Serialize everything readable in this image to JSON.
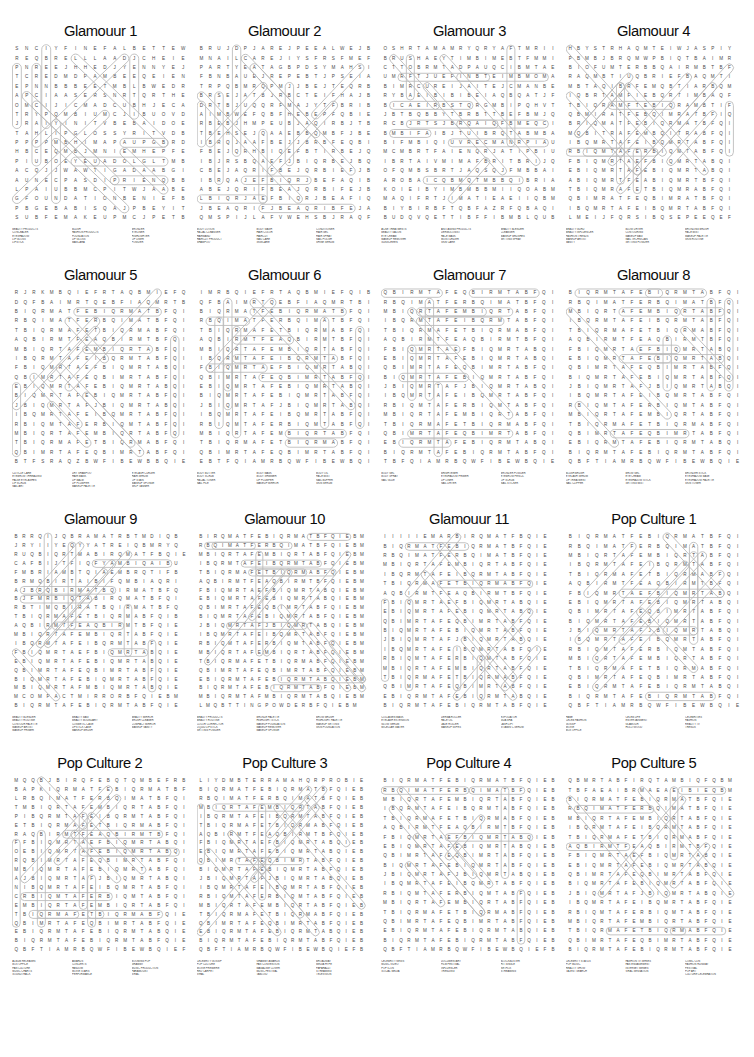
{
  "page": {
    "background_color": "#ffffff",
    "grid_letter_color": "#4a4a4a",
    "ring_color": "#b9b9b9",
    "title_color": "#0b0b0b",
    "layout": "4 columns x 4 rows of word-search puzzles",
    "rows": 4,
    "columns": 4
  },
  "puzzles": [
    {
      "title": "Glamouur 1",
      "grid_cols": 18,
      "grid_rows": 19,
      "grid": [
        "SNCIYFINEFALBETTEWB",
        "REQBRELLLAADJCHEIEQB",
        "PNREEJHHEDJYENNYEJ",
        "TCREDMDPAMBEEQEIENI",
        "EPNNBBBEETMBLBWEDRB",
        "APCIAASERSNRTQRTHEQD",
        "OMCIJICMADCUBHJECATE",
        "TRYPQMBIUMCJIBUOVDHI",
        "JRAIYINITVBEBAIDOEM",
        "TAHLIPGLOSSYRITVDBIS",
        "PPPPMBHIMAPAUPGBRDLT",
        "HBCEQMBJMNIEMHEPFEQ",
        "PIUBOEYEUADOLGLTMBQ",
        "ACQJJWAWTIGADAABGIP",
        "AUNECPASDIPRIENQBBQL",
        "LPAIUBBMCPITWJAABEQB",
        "GFOUNDATIONBENIEFBP",
        "PBGEBABISQAJPBEYITIN",
        "SUBFEMAKEUPMCJPETBQE"
      ],
      "words": [
        [
          "BEAUTY PRODUCTS",
          "CONCEALER",
          "EYESHADOW",
          "LIP GLOSS",
          "LIPSTICK"
        ],
        [
          "BLUSH",
          "FASHION PRODUCTS",
          "FOUNDATION",
          "LIP GLOSS",
          "MASCARA"
        ],
        [
          "BRONZER",
          "EYELINER",
          "HIGHLIGHTER",
          "LIP LINER",
          "POWDER"
        ]
      ]
    },
    {
      "title": "Glamouur 2",
      "grid_cols": 20,
      "grid_rows": 19,
      "grid": [
        "BRUJDPJAREJPEEALWEJBTT",
        "MNAILCAREJIYSFRSFMEFMG",
        "PARTYEATAGBPDSYMAHSIPWU",
        "FBNBAUEJREPEBTJPSEIAFR",
        "TRPQBMRQPMJJBEJTEQRBAE",
        "BRSEJATBJRBCTEIFHAJBIN",
        "DRTBJUQQRFMAJYTFBRIBQU",
        "AIMBWEFQBFHEBEPFQBIEAR",
        "RBEBJHMPEUBJAQIRBJTBAB",
        "TBEHSEJQAAEBBQMBFJBEIT",
        "IBRQJAAFBEJJBRBFEQBIJA",
        "FBEJQRHBIQEFBTIRBEJQBE",
        "IBJRSBQAEFJBIQRBEJBQAR",
        "CBEJAQRIFBEJQRBIEFJBQA",
        "IBRQAJEFBIQRJBEFAQIBRE",
        "ABEJQRIFBEAJQRBIFEJBQR",
        "LBIQRJAEFBIQRJBEAFIQBR",
        "JBEAQRIFJBEAQRIBFEJAQR",
        "QMSPIJLAFVWEHSBJRAQFIE"
      ],
      "words": [
        [
          "BODY LOTION",
          "FACIAL CLEANSER",
          "HAIRBAND",
          "HAIRCUT PRODUCT",
          "SHAMPOO"
        ],
        [
          "BODY WASH",
          "HAIR COLOR",
          "HAIRCUT",
          "NAIL CARE",
          "SKINCARE"
        ],
        [
          "CONDITIONER",
          "HAIR GEL",
          "HAIR SPRAY",
          "NAIL POLISH",
          "SHINE SERUM"
        ]
      ]
    },
    {
      "title": "Glamouur 3",
      "grid_cols": 21,
      "grid_rows": 19,
      "grid": [
        "OSHRTAMAMRYQRYAFTMRIITM",
        "BRUSHAEYTIMBIMEBTFMMIU",
        "CTTOBRMTADPAUQCIBMTAE",
        "UMRFTJUEFINBTEIMBMOMAE",
        "BIMRCUREIJAITEJCMANBEB",
        "RYBAEIBIBIBEIAQBQATJFB",
        "BICAEIRBSTQRGMBIPQHVTBI",
        "JBTBQBBYTBRBTTBEFBMJQU",
        "RCBJRTSJBRQAIQFBMEQCIB",
        "BMBIFAIBJTUIBRQTABMBAA",
        "BIFMBIQIUVRECMANRPIAU",
        "MCMBRTFAIENQRJATIPBIU",
        "IBRTAIVMIMAFBRITBRIJQUT",
        "OFQMBSBRTJAQSQJFMBBAIF",
        "AROBAICQBMQTMBBQIBRIAE",
        "KOIEIBYIMBMBBMIIQOABMB",
        "MAQIFRTJIMATIEAEIIQBM",
        "BIYBIRBFTQBFAZRFQBAQIB",
        "BUDQVQETTIBFFIBMBLQUB"
      ],
      "words": [
        [
          "ACNE TREATMENTS",
          "BEAUTY SALON",
          "EYE CREAM",
          "MAKEUP REMOVER",
          "SUNSCREEN"
        ],
        [
          "ANTI AGING PRODUCTS",
          "DERMOLOGIST",
          "FACE MASK",
          "MOISTURIZER",
          "SKIN CARE"
        ],
        [
          "BEAUTY BLENDER",
          "CLEANSER",
          "MAKEUP BRUSHES",
          "SETTING SPRAY"
        ]
      ]
    },
    {
      "title": "Glamouur 4",
      "grid_cols": 21,
      "grid_rows": 19,
      "grid": [
        "HBYSTRHAQMTEIWJASPIY",
        "PBMBJBRQMWPBIQTBAIMR",
        "BIOFUMTERBBQAIRMBTBF",
        "RAQMBTIUQBRIEFBAQMTI",
        "MBTAQIBRFEMQBTIARBQM",
        "IQBRTAMFIEBQRTIMBAQF",
        "TBIQRAMFTEBIQRAMBTIF",
        "QBMIRATFEBQIMRATBFIQ",
        "BRIQMATFEBIQRMATBFQI",
        "MQBITRAFEMBQITRABFQI",
        "IBQMRTAFEIBQMRTABFQI",
        "RBIQMTAFERBIQMTABFQI",
        "FBIQMRTAEFBIQMRTABQI",
        "EBIQMRTAFEBIQMRTABQI",
        "ABIQMRTFEABIQMRTBFQI",
        "TBIQMRAFETBIQMRABFQI",
        "QBIMRATFEQBIMRATBFQI",
        "IBQMRTAFEIBQMRTABFQI",
        "LMEIJFQRSIBQSEPEEQEF"
      ],
      "words": [
        [
          "BEAUTY GURU",
          "BEAUTY INFLUENCER",
          "FASHION TRENDS",
          "MAKEUP ARTIST",
          "VANITY"
        ],
        [
          "BLOW DRYER",
          "CONTOURING",
          "MAKEUP BAG",
          "NAIL TECHNICIAN",
          "SETTING POWDER"
        ],
        [
          "BRONZING BRUSH",
          "FACE MIST",
          "MAKEUP PALETTE",
          "SKIN ROUTINE"
        ]
      ]
    },
    {
      "title": "Glamouur 5",
      "grid_cols": 20,
      "grid_rows": 19,
      "grid": [
        "RJRKMBQIEFRTAQBMIEFQ",
        "DQFBAIMRTQEBFIAQMRTB",
        "BIQRMATFEBIQRMATBFQI",
        "RBQIMATFERBQIMATBFQI",
        "TBIQRMAFETBIQRMABFQI",
        "AQBIRMTFEAQBIRMTBFQI",
        "MBIQRTAFEMBIQRTABFQI",
        "IBQRMTAFEIBQRMTABFQI",
        "FBIQMRTAEFBIQMRTABQI",
        "QBIMRTAFEQBIMRTABFQI",
        "EBIQMRTAFEBIQMRTABQI",
        "BIQMRTAFEBIQMRTABFQI",
        "JBIQMRTAFJBIQMRTABQI",
        "IBQMRTAFEIBQMRTABFQI",
        "RBIQMTAFERBIQMTABFQI",
        "MBIQRTAFEMBIQRTABFQI",
        "TBIQRMAFETBIQRMABFQI",
        "QBIMRTAFEQBIMRTABFQI",
        "BTFSRAQZBWFIBEWBBQIE"
      ],
      "words": [
        [
          "CUTICLE CARE",
          "EYEBROW THREADING",
          "FALSE EYELASHES",
          "LIP SCRUB",
          "NAIL ART"
        ],
        [
          "DRY SHAMPOO",
          "HAIR MASK",
          "LIP BALM",
          "LIP PLUMPER",
          "MAKEUP PALETTE"
        ],
        [
          "EYELASH CURLER",
          "HAIR SERUM",
          "LIP STAIN",
          "MAKEUP SPONGE",
          "SELF TANNER"
        ]
      ]
    },
    {
      "title": "Glamouur 6",
      "grid_cols": 20,
      "grid_rows": 19,
      "grid": [
        "IMRBQIEFRTAQBMIEFQIB",
        "QFBAIMRTQEBFIAQMRTBI",
        "BIQRMATFEBIQRMATBFQI",
        "RBQIMATFERBQIMATBFQI",
        "TBIQRMAFETBIQRMABFQI",
        "AQBIRMTFEAQBIRMTBFQI",
        "MBIQRTAFEMBIQRTABFQI",
        "IBQRMTAFEIBQRMTABFQI",
        "FBIQMRTAEFBIQMRTABQI",
        "QBIMRTAFEQBIMRTABFQI",
        "EBIQMRTAFEBIQMRTABQI",
        "BIQMRTAFEBIQMRTABFQI",
        "JBIQMRTAFJBIQMRTABQI",
        "IBQMRTAFEIBQMRTABFQI",
        "RBIQMTAFERBIQMTABFQI",
        "MBIQRTAFEMBIQRTABFQI",
        "TBIQRMAFETBIQRMABFQI",
        "QBIMRTAFEQBIMRTABFQI",
        "EBTFQIAMRBQWFIBEWBQI"
      ],
      "words": [
        [
          "BODY BUTTER",
          "BODY SCRUB",
          "FACIAL TONER",
          "NAIL FILE"
        ],
        [
          "BODY MASK",
          "BODY SHIMMER",
          "LIP PLUMPER",
          "MAKEUP MIRROR"
        ],
        [
          "BODY OIL",
          "FACE MIST",
          "NAIL BUFFER",
          "SKIN SERUM"
        ]
      ]
    },
    {
      "title": "Glamouur 7",
      "grid_cols": 20,
      "grid_rows": 19,
      "grid": [
        "QBIRMTAFEQBIRMTABFQIE",
        "RBQIMATFERBQIMATBFQIE",
        "MBIQRTAFEMBIQRTABFQIE",
        "IBQRMTAFEIBQRMTABFQIE",
        "TBIQRMAFETBIQRMABFQIE",
        "AQBIRMTFEAQBIRMTBFQIE",
        "FBIQMRTAEFBIQMRTABQIE",
        "EBIQMRTAFEBIQMRTABQIE",
        "QBIMRTAFEQBIMRTABFQIE",
        "BIQMRTAFEBIQMRTABFQIE",
        "JBIQMRTAFJBIQMRTABQIE",
        "IBQMRTAFEIBQMRTABFQIE",
        "RBIQMTAFERBIQMTABFQIE",
        "MBIQRTAFEMBIQRTABFQIE",
        "TBIQRMAFETBIQRMABFQIE",
        "QBIMRTAFEQBIMRTABFQIE",
        "EBIQRMTAFEBIQRMTABQIE",
        "BIQRMTAFEBIQRMTABFQIE",
        "TBFQIAMRBQWFIBEWBQIEF"
      ],
      "words": [
        [
          "BODY GEL",
          "BODY SPRAY",
          "NAIL GLUE"
        ],
        [
          "BRIGHTENER",
          "EYESHADOW PRIMER",
          "LIP LINER",
          "NAIL DRYER"
        ],
        [
          "BRONZER POWDER",
          "EYEBROW PENCIL",
          "LIP SCRUB",
          "NAIL STICKER"
        ]
      ]
    },
    {
      "title": "Glamouur 8",
      "grid_cols": 20,
      "grid_rows": 19,
      "grid": [
        "BIQRMTAFEBIQRMTABFQIE",
        "RBQIMATFERBQIMATBFQIE",
        "MBIQRTAFEMBIQRTABFQIE",
        "IBQRMTAFEIBQRMTABFQIE",
        "TBIQRMAFETBIQRMABFQIE",
        "AQBIRMTFEAQBIRMTBFQIE",
        "FBIQMRTAEFBIQMRTABQIE",
        "EBIQMRTAFEBIQMRTABQIE",
        "QBIMRTAFEQBIMRTABFQIE",
        "BIQMRTAFEBIQMRTABFQIE",
        "JBIQMRTAFJBIQMRTABQIE",
        "IBQMRTAFEIBQMRTABFQIE",
        "RBIQMTAFERBIQMTABFQIE",
        "MBIQRTAFEMBIQRTABFQIE",
        "TBIQRMAFETBIQRMABFQIE",
        "QBIMRTAFEQBIMRTABFQIE",
        "EBIQRMTAFEBIQRMTABQIE",
        "BIQRMTAFEBIQRMTABFQIE",
        "QBFTIAMRBQWFIBEWBQIEF"
      ],
      "words": [
        [
          "BLUSH BRUSH",
          "EYELASH SERUM",
          "LIP TREATMENT",
          "NAIL CLIPPER"
        ],
        [
          "BROW GEL",
          "EYE CREAM",
          "EYESHADOW STICK",
          "SETTING MIST"
        ],
        [
          "BRONZER STICK",
          "EYESHADOW BASE",
          "EYESHADOW PALETTE",
          "SKIN TONER"
        ]
      ]
    },
    {
      "title": "Glamouur 9",
      "grid_cols": 22,
      "grid_rows": 20,
      "grid": [
        "BRRQIJQBRAMATRBTMDIQB",
        "JRYIIYEQYYATREIQBMRYQ",
        "RUQBIQRTMABIRQMATFBQIE",
        "CAFBIJTFIQFYAMBIQAIBU",
        "FMBRIAMBTQIAEMBRQTIFB",
        "BRMQBIRTAIBIFQMBIAQRI",
        "AJBRQBIRMATBQIRMATBFQ",
        "BJFMRBIQTABIRQMATBFQI",
        "RBTIMQBIRATBQIRMATBFQ",
        "TBIQRMAFETBIQRMABFQIB",
        "AQBIRMTFEAQBIRMTBFQIE",
        "MBIQRTAFEMBIQRTABFQIE",
        "IBQRMTAFEIBQRMTABFQIE",
        "FBIQMRTAEFBIQMRTABQIE",
        "EBIQMRTAFEBIQMRTABQIE",
        "QBIMRTAFEQBIMRTABFQIE",
        "BIQMRTAFEBIQMRTABFQIE",
        "MBIQMRTAFMBIQMRTABQIE",
        "MCOMPACTMIRRORBFQIEBM",
        "BIQRMTAFEBIQRMTABFQIE"
      ],
      "words": [
        [
          "BEAUTY BLENDER",
          "BEAUTY ROUTINE",
          "CONTOUR PALETTE",
          "MAKEUP ARTIST",
          "MAKEUP PRIMER"
        ],
        [
          "BEAUTY BAG",
          "BEAUTY BOUNDARY",
          "COSMETIC CASE",
          "LIPSTICK CASE",
          "MAKEUP BRUSH"
        ],
        [
          "BEAUTY MIRROR",
          "BRUSH CLEANER",
          "COMPACT MIRROR",
          "MAKEUP VANITY"
        ]
      ]
    },
    {
      "title": "Glamouur 10",
      "grid_cols": 24,
      "grid_rows": 20,
      "grid": [
        "BIRQMATFEBIQRMATBFQIEBM",
        "RBQIMATFERBQIMATBFQIEBM",
        "MBIQRTAFEMBIQRTABFQIEBM",
        "IBQRMTAFEIBQRMTABFQIEBM",
        "TBIQRMAFETBIQRMABFQIEBM",
        "AQBIRMTFEAQBIRMTBFQIEBM",
        "FBIQMRTAEFBIQMRTABQIEBM",
        "EBIQMRTAFEBIQMRTABQIEBM",
        "QBIMRTAFEQBIMRTABFQIEBM",
        "BIQMRTAFEBIQMRTABFQIEBM",
        "JBIQMRTAFJBIQMRTABQIEBM",
        "IBQMRTAFEIBQMRTABFQIEBM",
        "RBIQMTAFERBIQMTABFQIEBM",
        "MBIQRTAFEMBIQRTABFQIEBM",
        "TBIQRMAFETBIQRMABFQIEBM",
        "QBIMRTAFEQBIMRTABFQIEBM",
        "EBIQRMTAFEBIQRMTABQIEBM",
        "BIQRMTAFEBIQRMTABFQIEBM",
        "MBIQRMTAFMBIQRMTABQIEBM",
        "LMQBTTINGPOWDERBFQIEBM"
      ],
      "words": [
        [
          "BEAUTY PRODUCTS",
          "BEAUTY ROUTINE",
          "COLOR CORRECTOR",
          "LIQUID LIPSTICK",
          "SETTING POWDER"
        ],
        [
          "BRONZE PALETTE",
          "HIGHLIGHT STICK",
          "MAKEUP FOUNDATION",
          "MAKEUP REMOVER",
          "MAKEUP SPONGE"
        ],
        [
          "BROW BRUSH",
          "HIGHLIGHT PALETTE",
          "MAKEUP SETTING",
          "SKIN FOUNDATION"
        ]
      ]
    },
    {
      "title": "Glamouur 11",
      "grid_cols": 22,
      "grid_rows": 19,
      "grid": [
        "IIIIIEMARBIRQMATFBQIE",
        "BIQRMATFEBIQRMATBFQIE",
        "RBQIMATFERBQIMATBFQIE",
        "MBIQRTAFEMBIQRTABFQIE",
        "IBQRMTAFEIBQRMTABFQIE",
        "TBIQRMAFETBIQRMABFQIE",
        "AQBIRMTFEAQBIRMTBFQIE",
        "FBIQMRTAEFBIQMRTABQIE",
        "EBIQMRTAFEBIQMRTABQIE",
        "QBIMRTAFEQBIMRTABFQIE",
        "BIQMRTAFEBIQMRTABFQIE",
        "JBIQMRTAFJBIQMRTABQIE",
        "IBQMRTAFEIBQMRTABFQIE",
        "RBIQMTAFERBIQMTABFQIE",
        "MBIQRTAFEMBIQRTABFQIE",
        "TBIQRMAFETBIQRMABFQIE",
        "QBIMRTAFEQBIMRTABFQIE",
        "EBIQRMTAFEBIQRMTABQIE",
        "BIQRMTAFEBIQRMTABFQIE"
      ],
      "words": [
        [
          "COLLAGEN MASK",
          "EYELASH EXTENSION",
          "GLOW SERUM",
          "MICELLAR WATER"
        ],
        [
          "DERMA ROLLER",
          "FACE OIL",
          "JADE ROLLER",
          "MAKEUP WIPES"
        ],
        [
          "EXFOLIATOR",
          "GUA SHA",
          "LASH LIFT",
          "VITAMIN C SERUM"
        ]
      ]
    },
    {
      "title": "Pop Culture 1",
      "grid_cols": 20,
      "grid_rows": 19,
      "grid": [
        "BIQRMATFEBIQRMATBFQIE",
        "RBQIMATFERBQIMATBFQIE",
        "MBIQRTAFEMBIQRTABFQIE",
        "IBQRMTAFEIBQRMTABFQIE",
        "TBIQRMAFETBIQRMABFQIE",
        "AQBIRMTFEAQBIRMTBFQIE",
        "FBIQMRTAEFBIQMRTABQIE",
        "EBIQMRTAFEBIQMRTABQIE",
        "QBIMRTAFEQBIMRTABFQIE",
        "BIQMRTAFEBIQMRTABFQIE",
        "JBIQMRTAFJBIQMRTABQIE",
        "IBQMRTAFEIBQMRTABFQIE",
        "RBIQMTAFERBIQMTABFQIE",
        "MBIQRTAFEMBIQRTABFQIE",
        "TBIQRMAFETBIQRMABFQIE",
        "QBIMRTAFEQBIMRTABFQIE",
        "EBIQRMTAFEBIQRMTABQIE",
        "BIQRMTAFEBIQRMTABFQIE",
        "QBFTIAMRBQWFIBEWBQIEF"
      ],
      "words": [
        [
          "FAME",
          "CELEB FASHION",
          "GOSSIP",
          "MOVIE",
          "BOX OFFICE"
        ],
        [
          "CELEB LIFE",
          "ENTERTAINMENT",
          "GLAMOUR",
          "HOLLYWOOD"
        ],
        [
          "CELEBRITIES",
          "FASHION",
          "REALITY TV",
          "TRENDS"
        ]
      ]
    },
    {
      "title": "Pop Culture 2",
      "grid_cols": 21,
      "grid_rows": 20,
      "grid": [
        "MQQBJBIRQFEBQTQMBEFRB",
        "BAPKIQRMATFEBIQRMATBF",
        "LRBQIMATFERBQIMATBFQI",
        "TMBIQRTAFEMBIQRTABFQI",
        "PIBQRMTAFEIBQRMTABFQI",
        "ETBIQRMAFETBIQRMABFQI",
        "RAQBIRMTFEAQBIRMTBFQI",
        "FFBIQMRTAEFBIQMRTABQI",
        "OEBIQMRTAFEBIQMRTABQI",
        "RQBIMRTAFEQBIMRTABFQI",
        "MBIQMRTAFEBIQMRTABFQI",
        "AJBIQMRTAFJBIQMRTABQI",
        "NIBQMRTAFEIBQMRTABFQI",
        "CRBIQMTAFERBIQMTABFQI",
        "EMBIQRTAFEMBIQRTABFQI",
        "TBIQRMAFETBIQRMABFQIE",
        "QBIMRTAFEQBIMRTABFQIE",
        "EBIQRMTAFEBIQRMTABQIE",
        "BIQRMTAFEBIQRMTABFQIE",
        "QBFTIAMRBQWFIBEWBQIEF"
      ],
      "words": [
        [
          "ALBUM RELEASES",
          "BOX OFFICE",
          "FAN CULTURE",
          "MUSIC CHARTS",
          "SOUNDTRACK"
        ],
        [
          "AWARDS",
          "CONCERTS",
          "FANDOM",
          "MOVIE STARS",
          "PERFORMANCE"
        ],
        [
          "BOOMING POP",
          "GRAMMY",
          "MUSIC PRODUCTION",
          "PARAMOUNT",
          "VIRAL"
        ]
      ]
    },
    {
      "title": "Pop Culture 3",
      "grid_cols": 23,
      "grid_rows": 20,
      "grid": [
        "LIYDMBTERRAMAHQRPROBIE",
        "BIQRMATFEBIQRMATBFQIEB",
        "RBQIMATFERBQIMATBFQIEB",
        "MBIQRTAFEMBIQRTABFQIEB",
        "IBQRMTAFEIBQRMTABFQIEB",
        "TBIQRMAFETBIQRMABFQIEB",
        "AQBIRMTFEAQBIRMTBFQIEB",
        "FBIQMRTAEFBIQMRTABQIEB",
        "EBIQMRTAFEBIQMRTABQIEB",
        "QBIMRTAFEQBIMRTABFQIEB",
        "BIQMRTAFEBIQMRTABFQIEB",
        "JBIQMRTAFJBIQMRTABQIEB",
        "IBQMRTAFEIBQMRTABFQIEB",
        "RBIQMTAFERBIQMTABFQIEB",
        "MBIQRTAFEMBIQRTABFQIEB",
        "TBIQRMAFETBIQRMABFQIEB",
        "QBIMRTAFEQBIMRTABFQIEB",
        "EBIQRMTAFEBIQRMTABQIEB",
        "BIQRMTAFEBIQRMTABFQIEB",
        "QBFTIAMRBQWFIBEWBQIEFB"
      ],
      "words": [
        [
          "CELEBRITY GOSSIP",
          "POP CULTURE",
          "MOVIE PREMIERE",
          "RED CARPET",
          "VIRAL"
        ],
        [
          "GRAMMY AWARDS",
          "FAN CONVENTION",
          "MAGAZINE COVER",
          "MUSIC FESTIVAL",
          "TABLOID"
        ],
        [
          "BROADWAY",
          "MEDIA HYPE",
          "PAPARAZZI",
          "STREAMING",
          "TELEVISION"
        ]
      ]
    },
    {
      "title": "Pop Culture 4",
      "grid_cols": 22,
      "grid_rows": 19,
      "grid": [
        "BIQRMATFEBIQRMATBFQIEB",
        "RBQIMATFERBQIMATBFQIEB",
        "MBIQRTAFEMBIQRTABFQIEB",
        "IBQRMTAFEIBQRMTABFQIEB",
        "TBIQRMAFETBIQRMABFQIEB",
        "AQBIRMTFEAQBIRMTBFQIEB",
        "FBIQMRTAEFBIQMRTABQIEB",
        "EBIQMRTAFEBIQMRTABQIEB",
        "QBIMRTAFEQBIMRTABFQIEB",
        "BIQMRTAFEBIQMRTABFQIEB",
        "JBIQMRTAFJBIQMRTABQIEB",
        "IBQMRTAFEIBQMRTABFQIEB",
        "RBIQMTAFERBIQMTABFQIEB",
        "MBIQRTAFEMBIQRTABFQIEB",
        "TBIQRMAFETBIQRMABFQIEB",
        "QBIMRTAFEQBIMRTABFQIEB",
        "EBIQRMTAFEBIQRMTABQIEB",
        "BIQRMTAFEBIQRMTABFQIEB",
        "QBFTIAMRBQWFIBEWBQIEFB"
      ],
      "words": [
        [
          "CELEBRITY NEWS",
          "MUSIC VIDEO",
          "POP ICON",
          "SOCIAL MEDIA"
        ],
        [
          "DOCUMENTARY",
          "FILM FESTIVAL",
          "INFLUENCER",
          "TRENDING"
        ],
        [
          "BLOCKBUSTER",
          "HIT SINGLE",
          "NETFLIX",
          "STREAMING"
        ]
      ]
    },
    {
      "title": "Pop Culture 5",
      "grid_cols": 22,
      "grid_rows": 19,
      "grid": [
        "QBMRTABFIRQTAMBIQFQBM",
        "TBFAEAIBRMAEAEIBIEQBM",
        "BIQRMATFEBIQRMATBFQIE",
        "RBQIMATFERBQIMATBFQIE",
        "MBIQRTAFEMBIQRTABFQIE",
        "IBQRMTAFEIBQRMTABFQIE",
        "TBIQRMAFETBIQRMABFQIE",
        "AQBIRMTFEAQBIRMTBFQIE",
        "FBIQMRTAEFBIQMRTABQIE",
        "EBIQMRTAFEBIQMRTABQIE",
        "QBIMRTAFEQBIMRTABFQIE",
        "BIQMRTAFEBIQMRTABFQIE",
        "JBIQMRTAFJBIQMRTABQIE",
        "IBQMRTAFEIBQMRTABFQIE",
        "RBIQMTAFERBIQMTABFQIE",
        "MBIQRTAFEMBIQRTABFQIE",
        "TBIQRMAFETBIQRMABFQIE",
        "QBIMRTAFEQBIMRTABFQIE",
        "BIQRMTAFEBIQRMTABFQIE"
      ],
      "words": [
        [
          "CELEBRITY STATUS",
          "POP MUSIC",
          "REALITY SHOW",
          "TALENT SEARCH"
        ],
        [
          "FASHION TV SERIES",
          "FAN ENGAGEMENT",
          "INTERNET MEMES",
          "VIRAL SENSATION"
        ],
        [
          "COMIC CON",
          "FASHION RUNWAY",
          "FESTIVAL",
          "POP ART",
          "CULTURE CELEBRATION"
        ]
      ]
    }
  ]
}
